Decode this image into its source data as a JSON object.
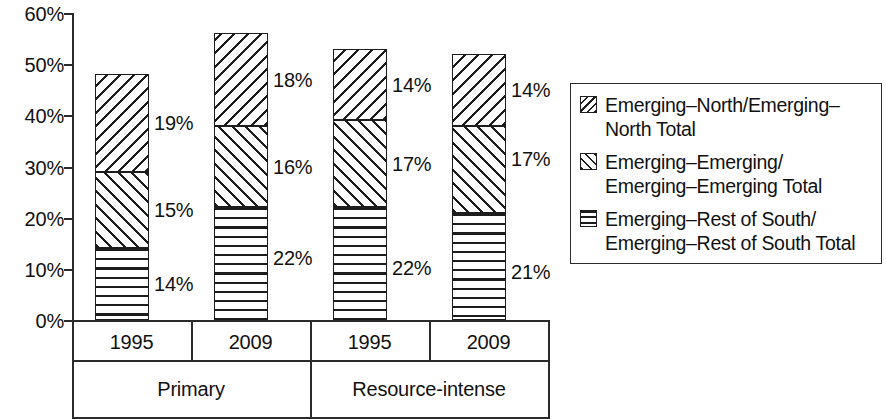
{
  "chart_data": {
    "type": "bar",
    "subtype": "stacked-vertical",
    "title": "",
    "xlabel": "",
    "ylabel": "",
    "ylim": [
      0,
      60
    ],
    "y_unit": "%",
    "grid": false,
    "legend_position": "right",
    "y_ticks": [
      "0%",
      "10%",
      "20%",
      "30%",
      "40%",
      "50%",
      "60%"
    ],
    "y_tick_values": [
      0,
      10,
      20,
      30,
      40,
      50,
      60
    ],
    "categories": [
      "1995",
      "2009",
      "1995",
      "2009"
    ],
    "group_labels": [
      "Primary",
      "Resource-intense"
    ],
    "group_spans": [
      2,
      2
    ],
    "series": [
      {
        "name": "Emerging–Rest of South/\nEmerging–Rest of South Total",
        "pattern": "horizontal-lines",
        "values": [
          14,
          22,
          22,
          21
        ],
        "labels": [
          "14%",
          "22%",
          "22%",
          "21%"
        ]
      },
      {
        "name": "Emerging–Emerging/\nEmerging–Emerging Total",
        "pattern": "forward-slash-hatch",
        "values": [
          15,
          16,
          17,
          17
        ],
        "labels": [
          "15%",
          "16%",
          "17%",
          "17%"
        ]
      },
      {
        "name": "Emerging–North/Emerging–\nNorth Total",
        "pattern": "backslash-hatch",
        "values": [
          19,
          18,
          14,
          14
        ],
        "labels": [
          "19%",
          "18%",
          "14%",
          "14%"
        ]
      }
    ],
    "totals": [
      48,
      56,
      53,
      52
    ]
  },
  "legend": {
    "items": [
      {
        "label": "Emerging–North/Emerging–\nNorth Total",
        "swatch": "backslash-hatch-swatch"
      },
      {
        "label": "Emerging–Emerging/\nEmerging–Emerging Total",
        "swatch": "forward-slash-hatch-swatch"
      },
      {
        "label": "Emerging–Rest of South/\nEmerging–Rest of South Total",
        "swatch": "horizontal-lines-swatch"
      }
    ]
  },
  "colors": {
    "ink": "#1d1d1d",
    "axis": "#2b2b2b",
    "background": "#ffffff"
  }
}
